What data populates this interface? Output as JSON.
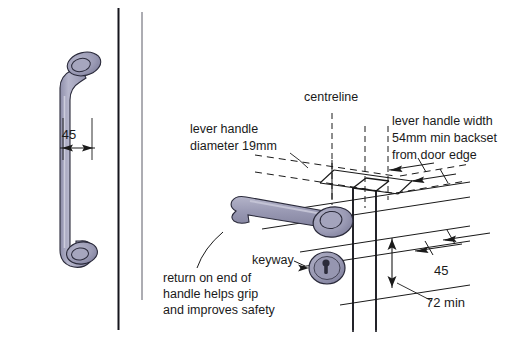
{
  "figure": {
    "background_color": "#ffffff",
    "line_color": "#1a1a1a",
    "metal_fill": "#9a9ab4",
    "metal_fill_light": "#b0b0c6",
    "metal_fill_dark": "#8286a0"
  },
  "labels": {
    "centreline": "centreline",
    "lever_handle_diameter_line1": "lever handle",
    "lever_handle_diameter_line2": "diameter 19mm",
    "lever_handle_width_line1": "lever handle width",
    "lever_handle_width_line2": "54mm min backset",
    "lever_handle_width_line3": "from door edge",
    "keyway": "keyway",
    "return_note_line1": "return on end of",
    "return_note_line2": "handle helps grip",
    "return_note_line3": "and improves safety"
  },
  "dimensions": {
    "left_handle_clearance": "45",
    "right_handle_clearance": "45",
    "handle_height_min": "72 min"
  },
  "icons": {
    "left_handle": "door-handle-side-view-icon",
    "lever_handle": "lever-handle-isometric-icon",
    "rose": "handle-rose-icon",
    "escutcheon": "keyway-escutcheon-icon",
    "keyhole": "keyhole-icon",
    "door_edge": "door-edge-isometric-icon",
    "arrow": "dimension-arrow-icon"
  }
}
